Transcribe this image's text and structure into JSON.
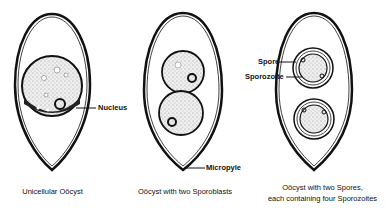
{
  "diagram": {
    "panels": [
      {
        "id": "unicellular",
        "caption": "Unicellular Oöcyst",
        "labels": [
          {
            "text": "Nucleus"
          }
        ]
      },
      {
        "id": "sporoblasts",
        "caption": "Oöcyst with two Sporoblasts",
        "labels": [
          {
            "text": "Micropyle"
          }
        ]
      },
      {
        "id": "spores",
        "caption_line1": "Oöcyst with two Spores,",
        "caption_line2": "each containing four Sporozoites",
        "labels": [
          {
            "text": "Spore"
          },
          {
            "text": "Sporozoite"
          }
        ]
      }
    ],
    "colors": {
      "ink": "#111111",
      "stipple": "#d8d8d8",
      "background": "#ffffff"
    }
  }
}
